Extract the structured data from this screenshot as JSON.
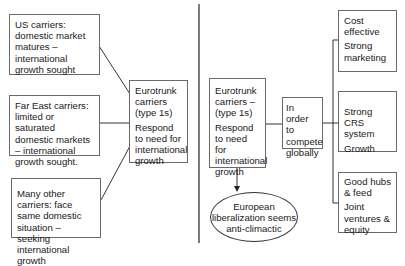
{
  "left_panel": {
    "sources": [
      {
        "text": "US carriers: domestic market matures – international growth sought"
      },
      {
        "text": "Far East carriers: limited or saturated domestic markets – international growth sought."
      },
      {
        "text": "Many other carriers: face same domestic situation – seeking international growth"
      }
    ],
    "eurotrunk": {
      "title": "Eurotrunk carriers (type 1s)",
      "body": "Respond to need for international growth"
    }
  },
  "right_panel": {
    "eurotrunk": {
      "title": "Eurotrunk carriers – (type 1s)",
      "body": "Respond to need for international growth"
    },
    "compete": {
      "text": "In order to compete globally"
    },
    "outcomes": [
      {
        "line1": "Cost effective",
        "line2": "Strong marketing"
      },
      {
        "line1": "Strong CRS system",
        "line2": "Growth"
      },
      {
        "line1": "Good hubs & feed",
        "line2": "Joint ventures & equity"
      }
    ],
    "result": {
      "line1": "European",
      "line2": "liberalization seems",
      "line3": "anti-climactic"
    }
  },
  "colors": {
    "line": "#333333",
    "border": "#6a6a6a",
    "text": "#1a1a1a"
  }
}
